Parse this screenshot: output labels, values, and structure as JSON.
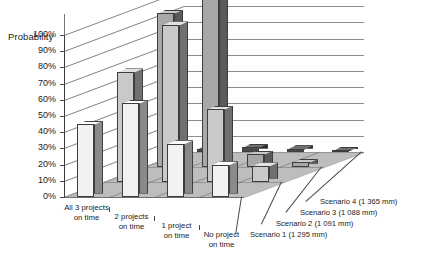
{
  "chart_data": {
    "type": "bar",
    "title": "",
    "subtitle": "",
    "ylabel": "Probability",
    "xlabel": "",
    "zlabel": "",
    "ylim": [
      0,
      100
    ],
    "yunit": "%",
    "grid": true,
    "legend_position": "depth-axis-right",
    "projection": "3d-column",
    "categories": [
      "All 3 projects\non time",
      "2 projects\non time",
      "1 project\non time",
      "No project\non time"
    ],
    "category_lines": [
      [
        "All 3 projects",
        "on time"
      ],
      [
        "2 projects",
        "on time"
      ],
      [
        "1 project",
        "on time"
      ],
      [
        "No project",
        "on time"
      ]
    ],
    "yticks": [
      "0%",
      "10%",
      "20%",
      "30%",
      "40%",
      "50%",
      "60%",
      "70%",
      "80%",
      "90%",
      "100%"
    ],
    "ytick_values": [
      0,
      10,
      20,
      30,
      40,
      50,
      60,
      70,
      80,
      90,
      100
    ],
    "series": [
      {
        "name": "Scenario 1 (1 295 mm)",
        "depth_index": 0,
        "color": "#f2f2f2",
        "side_color": "#8a8a8a",
        "top_color": "#ffffff",
        "values": [
          45,
          58,
          33,
          20
        ]
      },
      {
        "name": "Scenario 2 (1 091 mm)",
        "depth_index": 1,
        "color": "#c9c9c9",
        "side_color": "#707070",
        "top_color": "#e2e2e2",
        "values": [
          68,
          97,
          45,
          10
        ]
      },
      {
        "name": "Scenario 3 (1 088 mm)",
        "depth_index": 2,
        "color": "#a8a8a8",
        "side_color": "#5a5a5a",
        "top_color": "#c8c8c8",
        "values": [
          95,
          112,
          8,
          3
        ]
      },
      {
        "name": "Scenario 4 (1 365 mm)",
        "depth_index": 3,
        "color": "#4a4a4a",
        "side_color": "#2a2a2a",
        "top_color": "#707070",
        "values": [
          2,
          3,
          2,
          1
        ]
      }
    ],
    "scenario_labels": [
      "Scenario 4 (1 365 mm)",
      "Scenario 3 (1 088 mm)",
      "Scenario 2 (1 091 mm)",
      "Scenario 1 (1 295 mm)"
    ],
    "colors": {
      "floor": "#bdbdbd",
      "grid": "#8e8e8e",
      "axis": "#3a3a3a",
      "text": "#1a1a1a",
      "background": "#ffffff"
    }
  }
}
